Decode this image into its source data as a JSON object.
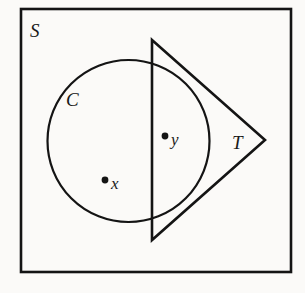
{
  "figure": {
    "background_color": "#fbfaf8",
    "ink_color": "#141414",
    "width": 305,
    "height": 293,
    "labels": {
      "universal_set": "S",
      "circle_region": "C",
      "triangle_region": "T",
      "point_x": "x",
      "point_y": "y"
    },
    "shapes": {
      "square": {
        "name": "S",
        "x": 21,
        "y": 9,
        "width": 270,
        "height": 263,
        "stroke_width": 2.6
      },
      "circle": {
        "name": "C",
        "cx": 128.5,
        "cy": 141,
        "r": 81,
        "stroke_width": 2.2
      },
      "triangle": {
        "name": "T",
        "points": "152,40 265,140 152,240",
        "stroke_width": 2.6
      }
    },
    "points": [
      {
        "name": "x",
        "label": "x",
        "cx": 105,
        "cy": 180,
        "r": 3.4,
        "label_x": 111,
        "label_y": 189,
        "inside_circle": true,
        "inside_triangle": false
      },
      {
        "name": "y",
        "label": "y",
        "cx": 165,
        "cy": 136,
        "r": 3.4,
        "label_x": 171,
        "label_y": 145,
        "inside_circle": true,
        "inside_triangle": true
      }
    ],
    "label_positions": {
      "S": {
        "x": 30,
        "y": 37
      },
      "C": {
        "x": 66,
        "y": 106
      },
      "T": {
        "x": 232,
        "y": 149
      }
    }
  }
}
